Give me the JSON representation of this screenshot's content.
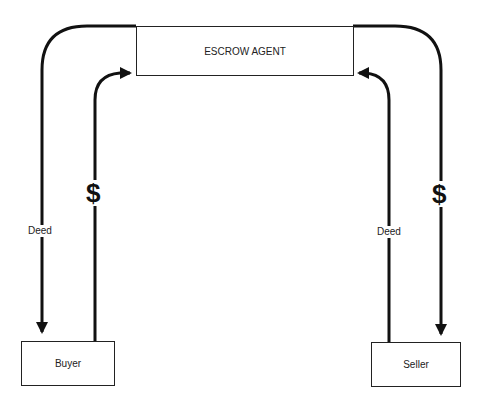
{
  "diagram": {
    "nodes": {
      "escrow_agent": {
        "label": "ESCROW AGENT"
      },
      "buyer": {
        "label": "Buyer"
      },
      "seller": {
        "label": "Seller"
      }
    },
    "edges": [
      {
        "from": "escrow_agent",
        "to": "buyer",
        "label": "Deed"
      },
      {
        "from": "buyer",
        "to": "escrow_agent",
        "label": "$"
      },
      {
        "from": "seller",
        "to": "escrow_agent",
        "label": "Deed"
      },
      {
        "from": "escrow_agent",
        "to": "seller",
        "label": "$"
      }
    ],
    "colors": {
      "line": "#111111",
      "box_border": "#222222",
      "background": "#ffffff"
    }
  }
}
